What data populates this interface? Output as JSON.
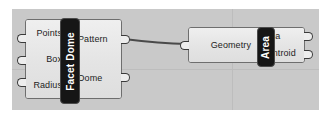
{
  "app": {
    "name": "Grasshopper Canvas",
    "canvas_background": "#c9c9c9",
    "grid_color": "#bdbdbd",
    "wire_color": "#4a4a4a"
  },
  "nodes": [
    {
      "id": "facet-dome",
      "name": "Facet Dome",
      "capsule_color": "#161616",
      "body_color": "#e6e6e6",
      "inputs": [
        {
          "label": "Points"
        },
        {
          "label": "Box"
        },
        {
          "label": "Radius"
        }
      ],
      "outputs": [
        {
          "label": "Pattern"
        },
        {
          "label": "Dome"
        }
      ]
    },
    {
      "id": "area",
      "name": "Area",
      "capsule_color": "#161616",
      "body_color": "#e6e6e6",
      "inputs": [
        {
          "label": "Geometry"
        }
      ],
      "outputs": [
        {
          "label": "Area"
        },
        {
          "label": "Centroid"
        }
      ]
    }
  ],
  "connections": [
    {
      "from_node": "facet-dome",
      "from_port": "Pattern",
      "to_node": "area",
      "to_port": "Geometry"
    }
  ]
}
